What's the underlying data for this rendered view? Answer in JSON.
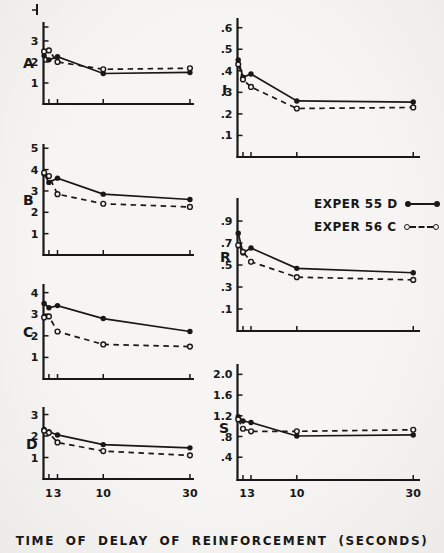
{
  "figure": {
    "caption": "TIME OF DELAY OF REINFORCEMENT (SECONDS)",
    "xtick_labels": [
      "1",
      "3",
      "10",
      "30"
    ],
    "colors": {
      "paper": "#f3f2f0",
      "ink": "#181818"
    }
  },
  "legend": {
    "position": "right-column, between panels I and R",
    "items": [
      {
        "label": "EXPER 55 D",
        "line": "solid",
        "marker": "filled-circle"
      },
      {
        "label": "EXPER 56 C",
        "line": "dashed",
        "marker": "open-circle"
      }
    ]
  },
  "chart_data": [
    {
      "id": "A",
      "label": "A",
      "type": "line",
      "grid": false,
      "x": [
        0,
        1,
        3,
        10,
        30
      ],
      "ylim": [
        0,
        3.9
      ],
      "yticks": [
        "1",
        "2",
        "3"
      ],
      "series": [
        {
          "name": "EXPER 55 D",
          "style": "solid",
          "marker": "filled",
          "values": [
            2.3,
            2.1,
            2.25,
            1.45,
            1.5
          ]
        },
        {
          "name": "EXPER 56 C",
          "style": "dashed",
          "marker": "open",
          "values": [
            2.5,
            2.55,
            2.0,
            1.65,
            1.7
          ]
        }
      ]
    },
    {
      "id": "B",
      "label": "B",
      "type": "line",
      "grid": false,
      "x": [
        0,
        1,
        3,
        10,
        30
      ],
      "ylim": [
        0,
        5.2
      ],
      "yticks": [
        "1",
        "2",
        "3",
        "4",
        "5"
      ],
      "series": [
        {
          "name": "EXPER 55 D",
          "style": "solid",
          "marker": "filled",
          "values": [
            3.8,
            3.4,
            3.6,
            2.85,
            2.6
          ]
        },
        {
          "name": "EXPER 56 C",
          "style": "dashed",
          "marker": "open",
          "values": [
            3.85,
            3.7,
            2.85,
            2.4,
            2.25
          ]
        }
      ]
    },
    {
      "id": "C",
      "label": "C",
      "type": "line",
      "grid": false,
      "x": [
        0,
        1,
        3,
        10,
        30
      ],
      "ylim": [
        0,
        4.4
      ],
      "yticks": [
        "1",
        "2",
        "3",
        "4"
      ],
      "series": [
        {
          "name": "EXPER 55 D",
          "style": "solid",
          "marker": "filled",
          "values": [
            3.5,
            3.3,
            3.4,
            2.8,
            2.2
          ]
        },
        {
          "name": "EXPER 56 C",
          "style": "dashed",
          "marker": "open",
          "values": [
            2.85,
            2.9,
            2.2,
            1.6,
            1.5
          ]
        }
      ]
    },
    {
      "id": "D",
      "label": "D",
      "type": "line",
      "grid": false,
      "x": [
        0,
        1,
        3,
        10,
        30
      ],
      "ylim": [
        0,
        3.35
      ],
      "yticks": [
        "1",
        "2",
        "3"
      ],
      "series": [
        {
          "name": "EXPER 55 D",
          "style": "solid",
          "marker": "filled",
          "values": [
            2.3,
            2.2,
            2.05,
            1.6,
            1.45
          ]
        },
        {
          "name": "EXPER 56 C",
          "style": "dashed",
          "marker": "open",
          "values": [
            2.25,
            2.15,
            1.7,
            1.3,
            1.1
          ]
        }
      ]
    },
    {
      "id": "I",
      "label": "I",
      "type": "line",
      "grid": false,
      "x": [
        0,
        1,
        3,
        10,
        30
      ],
      "ylim": [
        0,
        0.645
      ],
      "yticks": [
        ".1",
        ".2",
        ".3",
        ".4",
        ".5",
        ".6"
      ],
      "series": [
        {
          "name": "EXPER 55 D",
          "style": "solid",
          "marker": "filled",
          "values": [
            0.45,
            0.37,
            0.385,
            0.26,
            0.255
          ]
        },
        {
          "name": "EXPER 56 C",
          "style": "dashed",
          "marker": "open",
          "values": [
            0.43,
            0.36,
            0.325,
            0.225,
            0.23
          ]
        }
      ]
    },
    {
      "id": "R",
      "label": "R",
      "type": "line",
      "grid": false,
      "x": [
        0,
        1,
        3,
        10,
        30
      ],
      "ylim": [
        -0.1,
        1.11
      ],
      "yticks": [
        ".1",
        ".3",
        ".5",
        ".7",
        ".9"
      ],
      "series": [
        {
          "name": "EXPER 55 D",
          "style": "solid",
          "marker": "filled",
          "values": [
            0.79,
            0.61,
            0.655,
            0.47,
            0.43
          ]
        },
        {
          "name": "EXPER 56 C",
          "style": "dashed",
          "marker": "open",
          "values": [
            0.68,
            0.62,
            0.53,
            0.39,
            0.365
          ]
        }
      ]
    },
    {
      "id": "S",
      "label": "S",
      "type": "line",
      "grid": false,
      "x": [
        0,
        1,
        3,
        10,
        30
      ],
      "ylim": [
        -0.04,
        2.2
      ],
      "yticks": [
        ".4",
        ".8",
        "1.2",
        "1.6",
        "2.0"
      ],
      "series": [
        {
          "name": "EXPER 55 D",
          "style": "solid",
          "marker": "filled",
          "values": [
            1.18,
            1.1,
            1.07,
            0.81,
            0.83
          ]
        },
        {
          "name": "EXPER 56 C",
          "style": "dashed",
          "marker": "open",
          "values": [
            1.13,
            0.95,
            0.9,
            0.9,
            0.93
          ]
        }
      ]
    }
  ]
}
